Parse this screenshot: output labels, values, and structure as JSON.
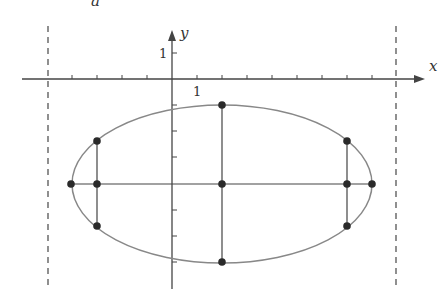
{
  "figure": {
    "top_label": "a",
    "x_axis_label": "x",
    "y_axis_label": "y",
    "x_unit_label": "1",
    "y_unit_label": "1",
    "colors": {
      "axis": "#444444",
      "ellipse": "#888888",
      "lines": "#444444",
      "points": "#2a2a2a",
      "directrix": "#555555"
    },
    "ellipse": {
      "center": [
        2,
        -4
      ],
      "semi_major": 6,
      "semi_minor": 3
    },
    "points": [
      {
        "name": "center",
        "x": 2,
        "y": -4
      },
      {
        "name": "top-vertex",
        "x": 2,
        "y": -1
      },
      {
        "name": "bottom-vertex",
        "x": 2,
        "y": -7
      },
      {
        "name": "left-vertex",
        "x": -4,
        "y": -4
      },
      {
        "name": "right-vertex",
        "x": 8,
        "y": -4
      },
      {
        "name": "left-focus",
        "x": -3,
        "y": -4
      },
      {
        "name": "right-focus",
        "x": 7,
        "y": -4
      },
      {
        "name": "latus-left-top",
        "x": -3,
        "y": -2.35
      },
      {
        "name": "latus-left-bottom",
        "x": -3,
        "y": -5.65
      },
      {
        "name": "latus-right-top",
        "x": 7,
        "y": -2.35
      },
      {
        "name": "latus-right-bottom",
        "x": 7,
        "y": -5.65
      }
    ],
    "directrices": [
      -5,
      9
    ]
  }
}
